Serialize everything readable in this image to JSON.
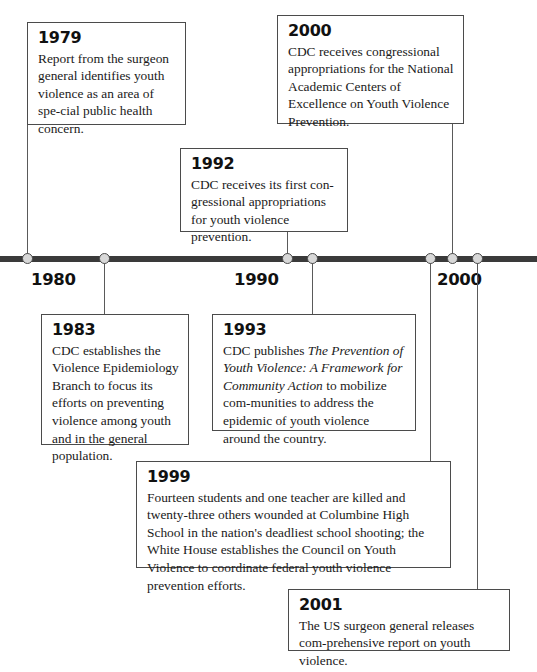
{
  "figure": {
    "type": "timeline",
    "orientation": "horizontal",
    "axis": {
      "labels": [
        "1980",
        "1990",
        "2000"
      ],
      "tick_years": [
        "1979",
        "1983",
        "1992",
        "1993",
        "1999",
        "2000",
        "2001"
      ],
      "line_color": "#3a3a3a",
      "marker_fill": "#d8d8d8",
      "marker_stroke": "#4a4a4a"
    },
    "events": [
      {
        "year": "1979",
        "side": "above",
        "text": "Report from the surgeon general identifies youth violence as an area of spe-cial public health concern.",
        "text_html": "Report from the surgeon general identifies youth violence as an area of spe-cial public health concern."
      },
      {
        "year": "2000",
        "side": "above",
        "text": "CDC receives congressional appropriations for the National Academic Centers of Excellence on Youth Violence Prevention."
      },
      {
        "year": "1992",
        "side": "above",
        "text": "CDC receives its first con-gressional appropriations for youth violence prevention."
      },
      {
        "year": "1983",
        "side": "below",
        "text": "CDC establishes the Violence Epidemiology Branch to focus its efforts on preventing violence among youth and in the general population."
      },
      {
        "year": "1993",
        "side": "below",
        "text": "CDC publishes The Prevention of Youth Violence: A Framework for Community Action to mobilize com-munities to address the epidemic of youth violence around the country.",
        "title_italic": "The Prevention of Youth Violence: A Framework for Community Action"
      },
      {
        "year": "1999",
        "side": "below",
        "text": "Fourteen students and one teacher are killed and twenty-three others wounded at Columbine High School in the nation's deadliest school shooting; the White House establishes the Council on Youth Violence to coordinate federal youth violence prevention efforts."
      },
      {
        "year": "2001",
        "side": "below",
        "text": "The US surgeon general releases com-prehensive report on youth violence."
      }
    ]
  }
}
